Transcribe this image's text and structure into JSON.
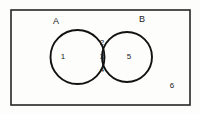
{
  "diagram": {
    "type": "venn-2-set",
    "background_color": "#fdfdfc",
    "stroke_color": "#121212",
    "universe": {
      "name": "universal-set",
      "label": "6",
      "label_x": 172,
      "label_y": 86,
      "rect": {
        "x": 11,
        "y": 10,
        "width": 179,
        "height": 95
      }
    },
    "sets": [
      {
        "id": "A",
        "label": "A",
        "label_x": 56,
        "label_y": 22,
        "cx": 77.5,
        "cy": 57,
        "r": 27
      },
      {
        "id": "B",
        "label": "B",
        "label_x": 142,
        "label_y": 20,
        "cx": 127,
        "cy": 57,
        "r": 25
      }
    ],
    "regions": [
      {
        "id": "a-only",
        "label": "1",
        "x": 63,
        "y": 57
      },
      {
        "id": "intersect-top",
        "label": "2",
        "x": 102,
        "y": 43
      },
      {
        "id": "intersect-mid",
        "label": "3",
        "x": 102,
        "y": 57
      },
      {
        "id": "intersect-bot",
        "label": "4",
        "x": 102,
        "y": 70
      },
      {
        "id": "b-only",
        "label": "5",
        "x": 129,
        "y": 57
      },
      {
        "id": "outside",
        "label": "6",
        "x": 172,
        "y": 86
      }
    ]
  }
}
